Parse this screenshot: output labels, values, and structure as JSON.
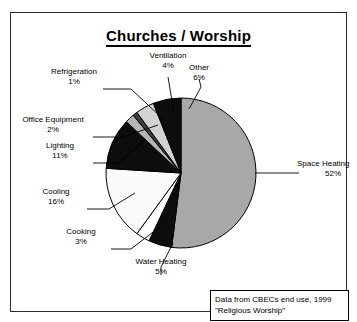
{
  "chart": {
    "title": "Churches / Worship",
    "frame_color": "#2b2b3a",
    "background": "#ffffff"
  },
  "source_note": {
    "line1": "Data from CBECs end use, 1999",
    "line2": "\"Religious Worship\""
  },
  "chart_data": {
    "type": "pie",
    "title": "Churches / Worship",
    "xlabel": "",
    "ylabel": "",
    "legend_position": "none",
    "grid": false,
    "units": "percent",
    "start_angle_deg": 0,
    "direction": "clockwise",
    "categories": [
      "Space Heating",
      "Water Heating",
      "Cooking",
      "Cooling",
      "Lighting",
      "Office Equipment",
      "Refrigeration",
      "Ventilation",
      "Other"
    ],
    "values": [
      52,
      5,
      3,
      16,
      11,
      2,
      1,
      4,
      6
    ],
    "colors": [
      "#a8a8a8",
      "#0d0d0d",
      "#ffffff",
      "#fafafa",
      "#0d0d0d",
      "#b5b5b5",
      "#3d3d3d",
      "#d2d2d2",
      "#0d0d0d"
    ],
    "labels": [
      {
        "name": "Space Heating",
        "pct": "52%"
      },
      {
        "name": "Water Heating",
        "pct": "5%"
      },
      {
        "name": "Cooking",
        "pct": "3%"
      },
      {
        "name": "Cooling",
        "pct": "16%"
      },
      {
        "name": "Lighting",
        "pct": "11%"
      },
      {
        "name": "Office Equipment",
        "pct": "2%"
      },
      {
        "name": "Refrigeration",
        "pct": "1%"
      },
      {
        "name": "Ventilation",
        "pct": "4%"
      },
      {
        "name": "Other",
        "pct": "6%"
      }
    ],
    "annotations": [
      "Data from CBECs end use, 1999",
      "\"Religious Worship\""
    ]
  }
}
